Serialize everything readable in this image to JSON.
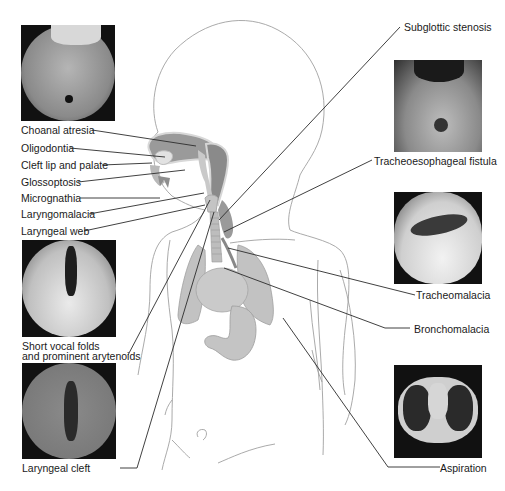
{
  "figure": {
    "type": "anatomical-diagram",
    "colors": {
      "label_text": "#1a1a1a",
      "leader_line": "#2b2b2b",
      "body_outline": "#9a9a9a",
      "organ_fill": "#bdbdbd",
      "organ_dark": "#8f8f8f"
    }
  },
  "left_labels": [
    {
      "id": "choanal-atresia",
      "text": "Choanal atresia"
    },
    {
      "id": "oligodontia",
      "text": "Oligodontia"
    },
    {
      "id": "cleft-lip-palate",
      "text": "Cleft lip and palate"
    },
    {
      "id": "glossoptosis",
      "text": "Glossoptosis"
    },
    {
      "id": "micrognathia",
      "text": "Micrognathia"
    },
    {
      "id": "laryngomalacia",
      "text": "Laryngomalacia"
    },
    {
      "id": "laryngeal-web",
      "text": "Laryngeal web"
    },
    {
      "id": "short-vocal-folds-1",
      "text": "Short vocal folds"
    },
    {
      "id": "short-vocal-folds-2",
      "text": "and prominent arytenoids"
    },
    {
      "id": "laryngeal-cleft",
      "text": "Laryngeal cleft"
    }
  ],
  "right_labels": [
    {
      "id": "subglottic-stenosis",
      "text": "Subglottic stenosis"
    },
    {
      "id": "tracheoesophageal-fistula",
      "text": "Tracheoesophageal fistula"
    },
    {
      "id": "tracheomalacia",
      "text": "Tracheomalacia"
    },
    {
      "id": "bronchomalacia",
      "text": "Bronchomalacia"
    },
    {
      "id": "aspiration",
      "text": "Aspiration"
    }
  ],
  "photos": [
    {
      "id": "choanal-atresia-endoscopy",
      "depicts": "Choanal atresia endoscopic view"
    },
    {
      "id": "short-vocal-folds-endoscopy",
      "depicts": "Short vocal folds and prominent arytenoids"
    },
    {
      "id": "laryngeal-cleft-endoscopy",
      "depicts": "Laryngeal cleft"
    },
    {
      "id": "tef-endoscopy",
      "depicts": "Tracheoesophageal fistula"
    },
    {
      "id": "tracheomalacia-endoscopy",
      "depicts": "Tracheomalacia"
    },
    {
      "id": "aspiration-ct",
      "depicts": "Chest CT showing aspiration"
    }
  ]
}
